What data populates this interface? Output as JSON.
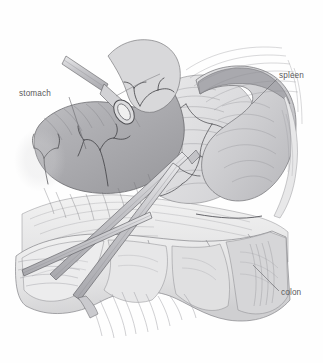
{
  "figure": {
    "kind": "medical-line-illustration",
    "width_px": 323,
    "height_px": 363,
    "background_color": "#fefefe",
    "ink_color": "#59595b",
    "line_color": "#6b6b6e"
  },
  "labels": [
    {
      "id": "stomach",
      "text": "stomach",
      "x": 19,
      "y": 89,
      "leader_from": [
        69,
        97
      ],
      "leader_to": [
        86,
        149
      ]
    },
    {
      "id": "spleen",
      "text": "spleen",
      "x": 279,
      "y": 71,
      "leader_from": [
        277,
        79
      ],
      "leader_to": [
        252,
        104
      ]
    },
    {
      "id": "colon",
      "text": "colon",
      "x": 281,
      "y": 288,
      "leader_from": [
        279,
        291
      ],
      "leader_to": [
        253,
        265
      ]
    }
  ],
  "structures": [
    {
      "id": "stomach",
      "name": "stomach",
      "tone": "#b4b4b7"
    },
    {
      "id": "spleen",
      "name": "spleen",
      "tone": "#cfcfd1"
    },
    {
      "id": "colon",
      "name": "transverse colon",
      "tone": "#e4e4e5"
    },
    {
      "id": "pancreas",
      "name": "pancreas",
      "tone": "#dcdcde"
    },
    {
      "id": "omentum",
      "name": "greater omentum",
      "tone": "#ededee"
    },
    {
      "id": "mesentery",
      "name": "mesentery",
      "tone": "#e9e9ea"
    },
    {
      "id": "vessels",
      "name": "gastroepiploic vessels",
      "tone": "#5a5a5c"
    }
  ],
  "instruments": [
    {
      "id": "clamp-upper",
      "name": "ring-tipped grasping clamp",
      "tone": "#d6d6d8"
    },
    {
      "id": "retractor-a",
      "name": "long retractor shaft",
      "tone": "#cfcfd2"
    },
    {
      "id": "retractor-b",
      "name": "long retractor shaft",
      "tone": "#cfcfd2"
    },
    {
      "id": "retractor-c",
      "name": "long retractor shaft",
      "tone": "#cfcfd2"
    }
  ]
}
